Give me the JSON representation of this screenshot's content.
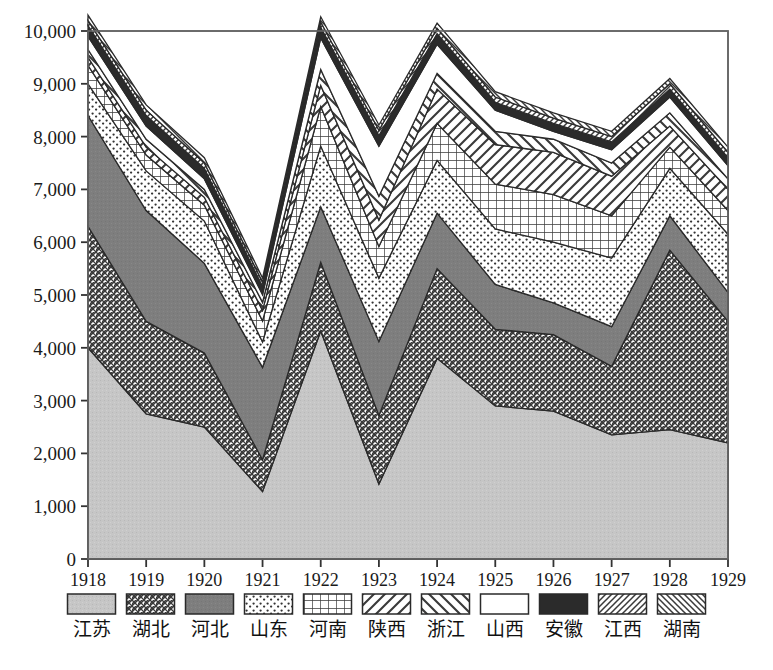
{
  "chart_data": {
    "type": "area",
    "title": "",
    "xlabel": "",
    "ylabel": "",
    "stacked": true,
    "grid": false,
    "legend_position": "bottom",
    "categories": [
      "1918",
      "1919",
      "1920",
      "1921",
      "1922",
      "1923",
      "1924",
      "1925",
      "1926",
      "1927",
      "1928",
      "1929"
    ],
    "x": [
      1918,
      1919,
      1920,
      1921,
      1922,
      1923,
      1924,
      1925,
      1926,
      1927,
      1928,
      1929
    ],
    "ylim": [
      0,
      10000
    ],
    "ytick_labels": [
      "0",
      "1,000",
      "2,000",
      "3,000",
      "4,000",
      "5,000",
      "6,000",
      "7,000",
      "8,000",
      "9,000",
      "10,000"
    ],
    "ytick_values": [
      0,
      1000,
      2000,
      3000,
      4000,
      5000,
      6000,
      7000,
      8000,
      9000,
      10000
    ],
    "series": [
      {
        "name": "江苏",
        "pattern": "solid-light-gray",
        "values": [
          4000,
          2750,
          2500,
          1280,
          4320,
          1420,
          3800,
          2900,
          2800,
          2350,
          2450,
          2200
        ]
      },
      {
        "name": "湖北",
        "pattern": "cross-hatch-fine",
        "values": [
          2300,
          1750,
          1400,
          600,
          1300,
          1300,
          1700,
          1450,
          1450,
          1300,
          3400,
          2300
        ]
      },
      {
        "name": "河北",
        "pattern": "solid-dark-gray",
        "values": [
          2100,
          2100,
          1700,
          1750,
          1050,
          1400,
          1050,
          850,
          600,
          750,
          650,
          550
        ]
      },
      {
        "name": "山东",
        "pattern": "dotted-speckle",
        "values": [
          600,
          750,
          800,
          480,
          1150,
          1200,
          1000,
          1050,
          1150,
          1300,
          900,
          1100
        ]
      },
      {
        "name": "河南",
        "pattern": "grid-square",
        "values": [
          350,
          300,
          300,
          400,
          750,
          600,
          700,
          850,
          900,
          800,
          400,
          450
        ]
      },
      {
        "name": "陕西",
        "pattern": "diagonal-wide-right",
        "values": [
          150,
          150,
          150,
          200,
          400,
          500,
          650,
          750,
          800,
          750,
          400,
          400
        ]
      },
      {
        "name": "浙江",
        "pattern": "diagonal-wide-left",
        "values": [
          150,
          150,
          150,
          150,
          300,
          450,
          300,
          250,
          250,
          250,
          250,
          200
        ]
      },
      {
        "name": "山西",
        "pattern": "white-blank",
        "values": [
          250,
          250,
          200,
          150,
          600,
          950,
          550,
          400,
          150,
          250,
          300,
          250
        ]
      },
      {
        "name": "安徽",
        "pattern": "solid-black",
        "values": [
          200,
          200,
          200,
          150,
          200,
          200,
          200,
          150,
          150,
          150,
          150,
          150
        ]
      },
      {
        "name": "江西",
        "pattern": "diagonal-fine-right",
        "values": [
          100,
          100,
          100,
          80,
          100,
          100,
          100,
          100,
          100,
          100,
          100,
          100
        ]
      },
      {
        "name": "湖南",
        "pattern": "diagonal-fine-left",
        "values": [
          100,
          100,
          100,
          80,
          100,
          100,
          100,
          100,
          100,
          100,
          100,
          100
        ]
      }
    ],
    "totals": [
      10300,
      8600,
      7600,
      5320,
      10290,
      8220,
      10150,
      8850,
      8350,
      8000,
      9100,
      7800
    ]
  },
  "legend": {
    "items": [
      {
        "label": "江苏",
        "pattern": "solid-light-gray"
      },
      {
        "label": "湖北",
        "pattern": "cross-hatch-fine"
      },
      {
        "label": "河北",
        "pattern": "solid-dark-gray"
      },
      {
        "label": "山东",
        "pattern": "dotted-speckle"
      },
      {
        "label": "河南",
        "pattern": "grid-square"
      },
      {
        "label": "陕西",
        "pattern": "diagonal-wide-right"
      },
      {
        "label": "浙江",
        "pattern": "diagonal-wide-left"
      },
      {
        "label": "山西",
        "pattern": "white-blank"
      },
      {
        "label": "安徽",
        "pattern": "solid-black"
      },
      {
        "label": "江西",
        "pattern": "diagonal-fine-right"
      },
      {
        "label": "湖南",
        "pattern": "diagonal-fine-left"
      }
    ]
  },
  "colors": {
    "axis": "#555555",
    "text": "#111111",
    "light_gray": "#c8c8c8",
    "dark_gray": "#8a8a8a",
    "black": "#2b2b2b",
    "white": "#ffffff"
  }
}
